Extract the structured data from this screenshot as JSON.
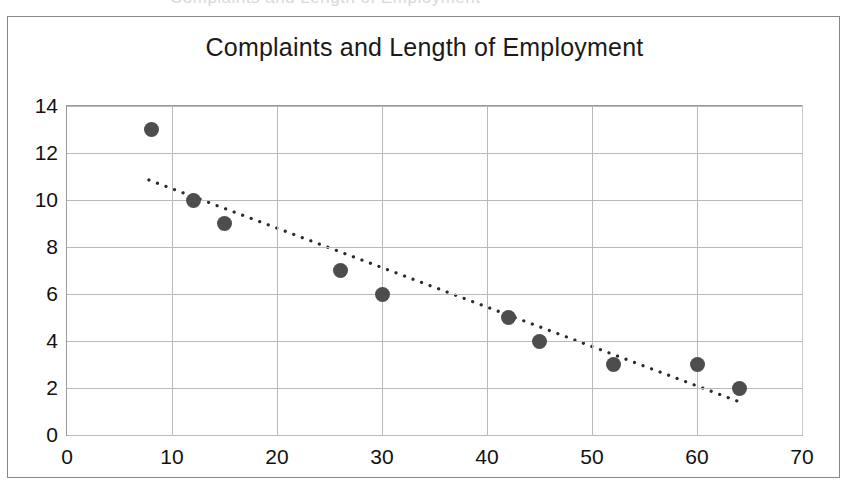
{
  "chart_data": {
    "type": "scatter",
    "title": "Complaints and Length of Employment",
    "xlabel": "",
    "ylabel": "",
    "xlim": [
      0,
      70
    ],
    "ylim": [
      0,
      14
    ],
    "xticks": [
      0,
      10,
      20,
      30,
      40,
      50,
      60,
      70
    ],
    "yticks": [
      0,
      2,
      4,
      6,
      8,
      10,
      12,
      14
    ],
    "grid": true,
    "legend": false,
    "marker_color": "#4d4d4d",
    "gridline_color": "#b9b9b9",
    "x": [
      8,
      12,
      15,
      26,
      30,
      42,
      45,
      52,
      60,
      64
    ],
    "y": [
      13,
      10,
      9,
      7,
      6,
      5,
      4,
      3,
      3,
      2
    ],
    "points": [
      {
        "x": 8,
        "y": 13
      },
      {
        "x": 12,
        "y": 10
      },
      {
        "x": 15,
        "y": 9
      },
      {
        "x": 26,
        "y": 7
      },
      {
        "x": 30,
        "y": 6
      },
      {
        "x": 42,
        "y": 5
      },
      {
        "x": 45,
        "y": 4
      },
      {
        "x": 52,
        "y": 3
      },
      {
        "x": 60,
        "y": 3
      },
      {
        "x": 64,
        "y": 2
      }
    ],
    "trendline": {
      "style": "dotted",
      "color": "#2b2b2b",
      "x_start": 7.8,
      "y_start": 10.85,
      "x_end": 63.8,
      "y_end": 1.45
    }
  },
  "ghost_text": "Complaints and Length of Employment"
}
